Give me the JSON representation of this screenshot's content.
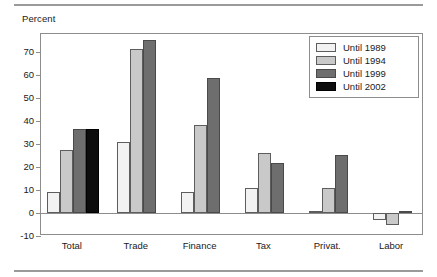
{
  "figure": {
    "y_axis_title": "Percent"
  },
  "legend": {
    "position": "top-right",
    "entries": [
      {
        "label": "Until 1989",
        "color": "#f2f2f2"
      },
      {
        "label": "Until 1994",
        "color": "#c9c9c9"
      },
      {
        "label": "Until 1999",
        "color": "#6e6e6e"
      },
      {
        "label": "Until 2002",
        "color": "#0d0d0d"
      }
    ]
  },
  "chart_data": {
    "type": "bar",
    "title": "",
    "subtitle": "",
    "xlabel": "",
    "ylabel": "Percent",
    "ylim": [
      -10,
      78
    ],
    "yticks": [
      -10,
      0,
      10,
      20,
      30,
      40,
      50,
      60,
      70
    ],
    "ytick_labels": [
      "-10",
      "0",
      "10",
      "20",
      "30",
      "40",
      "50",
      "60",
      "70"
    ],
    "grid": false,
    "legend_position": "top-right",
    "categories": [
      "Total",
      "Trade",
      "Finance",
      "Tax",
      "Privat.",
      "Labor"
    ],
    "series": [
      {
        "name": "Until 1989",
        "color": "#f2f2f2",
        "values": [
          9,
          31,
          9,
          11,
          1,
          -3
        ]
      },
      {
        "name": "Until 1994",
        "color": "#c9c9c9",
        "values": [
          27.5,
          71.5,
          38.5,
          26,
          11,
          -5
        ]
      },
      {
        "name": "Until 1999",
        "color": "#6e6e6e",
        "values": [
          36.5,
          75.5,
          59,
          22,
          25.5,
          1
        ]
      },
      {
        "name": "Until 2002",
        "color": "#0d0d0d",
        "values": [
          36.5,
          null,
          null,
          null,
          null,
          null
        ]
      }
    ]
  }
}
